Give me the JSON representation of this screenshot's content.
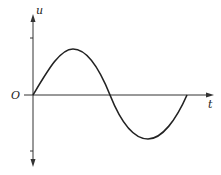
{
  "diagram": {
    "axes": {
      "y_label": "u",
      "x_label": "t",
      "origin_label": "O"
    },
    "curve": {
      "type": "sine",
      "periods": 1,
      "description": "One full period of a sine wave starting at the origin, rising to a positive peak, crossing zero at half period and ending at zero after a negative trough"
    },
    "ticks": {
      "positive_amplitude": "Um",
      "negative_amplitude": "-Um"
    },
    "colors": {
      "stroke": "#222222",
      "background": "#ffffff"
    }
  }
}
